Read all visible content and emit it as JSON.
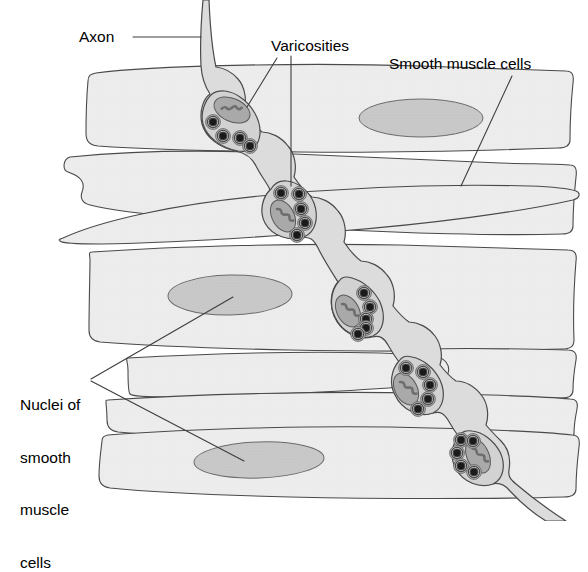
{
  "figure": {
    "background": "#ffffff",
    "width": 588,
    "height": 521
  },
  "labels": {
    "axon": "Axon",
    "varicosities": "Varicosities",
    "smooth_muscle_cells": "Smooth muscle cells",
    "nuclei_line1": "Nuclei of",
    "nuclei_line2": "smooth",
    "nuclei_line3": "muscle",
    "nuclei_line4": "cells"
  },
  "colors": {
    "outline": "#4a4a4a",
    "leader_line": "#3d3d3d",
    "muscle_fill": "#ededed",
    "nucleus_fill": "#c9c9c9",
    "axon_fill": "#dcdcdc",
    "varicosity_fill": "#d2d2d2",
    "mitochondrion_fill": "#a9a9a9",
    "mitochondrion_crista": "#6e6e6e",
    "vesicle_core": "#1a1a1a",
    "vesicle_ring": "#ffffff",
    "text": "#000000"
  },
  "structures": {
    "axon": {
      "name": "axon",
      "enters_at_top_x": 206,
      "exits_at_bottom_right": true,
      "varicosity_count": 5
    },
    "varicosities": [
      {
        "index": 1,
        "cx": 232,
        "cy": 115,
        "vesicles": 4,
        "mitochondria": 1
      },
      {
        "index": 2,
        "cx": 291,
        "cy": 205,
        "vesicles": 5,
        "mitochondria": 1
      },
      {
        "index": 3,
        "cx": 357,
        "cy": 315,
        "vesicles": 5,
        "mitochondria": 1
      },
      {
        "index": 4,
        "cx": 404,
        "cy": 392,
        "vesicles": 5,
        "mitochondria": 1
      },
      {
        "index": 5,
        "cx": 447,
        "cy": 451,
        "vesicles": 6,
        "mitochondria": 1
      }
    ],
    "smooth_muscle_cells": {
      "band_count": 7,
      "description": "Elongated spindle-shaped cells arranged in horizontal overlapping sheets"
    },
    "nuclei": [
      {
        "index": 1,
        "cx": 421,
        "cy": 118,
        "rx": 62,
        "ry": 19
      },
      {
        "index": 2,
        "cx": 230,
        "cy": 295,
        "rx": 62,
        "ry": 20
      },
      {
        "index": 3,
        "cx": 259,
        "cy": 460,
        "rx": 65,
        "ry": 18
      }
    ]
  },
  "leaders": {
    "axon": {
      "from": [
        133,
        37
      ],
      "to": [
        201,
        37
      ]
    },
    "varicosities_a": {
      "from": [
        277,
        58
      ],
      "to": [
        248,
        108
      ]
    },
    "varicosities_b": {
      "from": [
        291,
        56
      ],
      "to": [
        291,
        185
      ]
    },
    "smooth_muscle": {
      "from": [
        463,
        183
      ],
      "to": [
        512,
        77
      ]
    },
    "nuclei_a": {
      "from": [
        90,
        379
      ],
      "to": [
        232,
        296
      ]
    },
    "nuclei_b": {
      "from": [
        90,
        381
      ],
      "to": [
        243,
        461
      ]
    }
  }
}
